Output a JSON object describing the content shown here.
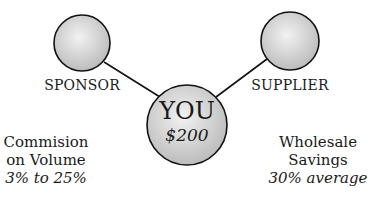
{
  "diagram": {
    "nodes": [
      {
        "id": "sponsor",
        "label": "SPONSOR",
        "cx": 82,
        "cy": 43,
        "r": 28
      },
      {
        "id": "supplier",
        "label": "SUPPLIER",
        "cx": 290,
        "cy": 41,
        "r": 29
      },
      {
        "id": "you",
        "label": "YOU",
        "value": "$200",
        "cx": 187,
        "cy": 125,
        "r": 40
      }
    ],
    "edges": [
      {
        "from": "sponsor",
        "to": "you"
      },
      {
        "from": "supplier",
        "to": "you"
      }
    ],
    "left_note": {
      "line1": "Commision",
      "line2": "on Volume",
      "line3": "3% to 25%"
    },
    "right_note": {
      "line1": "Wholesale",
      "line2": "Savings",
      "line3": "30% average"
    },
    "colors": {
      "stroke": "#111111",
      "fill_light": "#f2f2f2",
      "fill_dark": "#b8b8b8"
    }
  }
}
